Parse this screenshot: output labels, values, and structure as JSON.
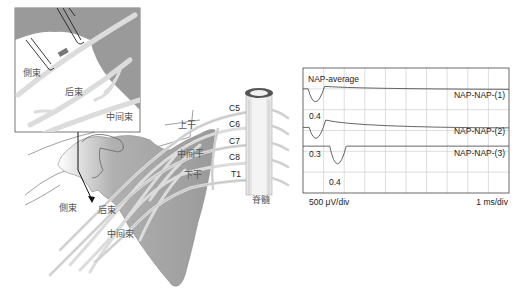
{
  "figure": {
    "inset_labels": {
      "lateral_cord": "側束",
      "posterior_cord": "后束",
      "medial_cord": "中间束"
    },
    "main_labels": {
      "upper_trunk": "上干",
      "middle_trunk": "中间干",
      "lower_trunk": "下干",
      "lateral_cord": "側束",
      "posterior_cord": "后束",
      "medial_cord": "中间束",
      "spinal_cord": "脊髓"
    },
    "roots": [
      "C5",
      "C6",
      "C7",
      "C8",
      "T1"
    ],
    "colors": {
      "scapula": "#9a9a9a",
      "nerve": "#d8d8d8",
      "outline": "#555555",
      "trace": "#555555",
      "grid": "#c8c8c8"
    }
  },
  "chart_data": {
    "type": "line",
    "title": "NAP-average",
    "x_scale_label": "1 ms/div",
    "y_scale_label": "500 μV/div",
    "x_divisions": 10,
    "y_divisions": 6,
    "grid": true,
    "series": [
      {
        "name": "NAP-NAP-(1)",
        "baseline_div": 1.0,
        "peak_label": "0.4",
        "peak_latency_div": 0.6,
        "peak_amplitude_div": -0.65,
        "overshoot_div": 0.12
      },
      {
        "name": "NAP-NAP-(2)",
        "baseline_div": 2.85,
        "peak_label": "0.3",
        "peak_latency_div": 0.65,
        "peak_amplitude_div": -0.6,
        "overshoot_div": 0.35
      },
      {
        "name": "NAP-NAP-(3)",
        "baseline_div": 3.75,
        "peak_label": "0.4",
        "peak_latency_div": 1.65,
        "peak_amplitude_div": -0.85,
        "overshoot_div": 0.0
      }
    ]
  }
}
